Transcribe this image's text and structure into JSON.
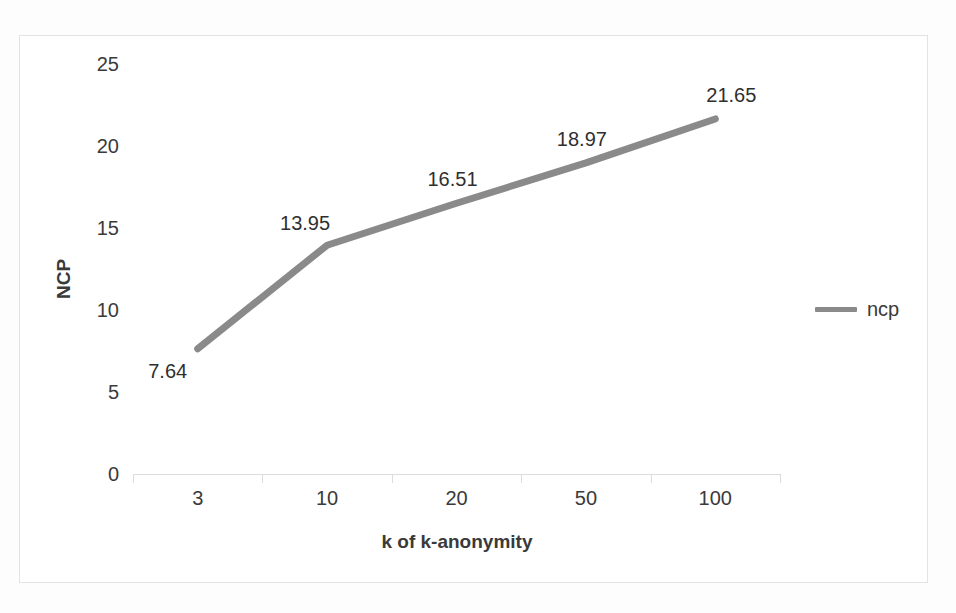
{
  "chart_data": {
    "type": "line",
    "title": "",
    "xlabel": "k of k-anonymity",
    "ylabel": "NCP",
    "categories": [
      "3",
      "10",
      "20",
      "50",
      "100"
    ],
    "values": [
      7.64,
      13.95,
      16.51,
      18.97,
      21.65
    ],
    "point_labels": [
      "7.64",
      "13.95",
      "16.51",
      "18.97",
      "21.65"
    ],
    "series": [
      {
        "name": "ncp",
        "values": [
          7.64,
          13.95,
          16.51,
          18.97,
          21.65
        ]
      }
    ],
    "ylim": [
      0,
      25
    ],
    "ytick_labels": [
      "0",
      "5",
      "10",
      "15",
      "20",
      "25"
    ],
    "ytick_values": [
      0,
      5,
      10,
      15,
      20,
      25
    ],
    "xtick_labels": [
      "3",
      "10",
      "20",
      "50",
      "100"
    ],
    "grid": false,
    "legend_position": "right",
    "line_color": "#8a8a8a",
    "text_color": "#3a3a3a",
    "axis_color": "#dcdcdc",
    "frame_color": "#e3e3e5",
    "background_color": "#ffffff"
  },
  "legend": {
    "entries": [
      {
        "label": "ncp",
        "color": "#8a8a8a"
      }
    ]
  }
}
